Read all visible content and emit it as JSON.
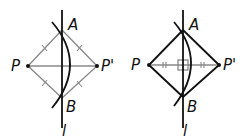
{
  "figures": [
    {
      "id": "left",
      "description": "Perpendicular bisector construction with congruent segment tick marks",
      "labels": {
        "A": "A",
        "B": "B",
        "P": "P",
        "P_prime": "P'",
        "line": "l"
      },
      "points": {
        "A": [
          62,
          30
        ],
        "B": [
          62,
          98
        ],
        "P": [
          28,
          66
        ],
        "P_prime": [
          97,
          66
        ]
      },
      "line_l": {
        "x": 62,
        "y1": 10,
        "y2": 128
      },
      "arc": {
        "from": [
          52,
          22
        ],
        "ctrl": [
          88,
          64
        ],
        "to": [
          52,
          108
        ]
      },
      "segments_style": "gray-with-single-ticks",
      "colors": {
        "thin": "#888888",
        "thick": "#111111"
      }
    },
    {
      "id": "right",
      "description": "Rhombus PAP'B with perpendicular diagonals marked by right-angle square and double ticks",
      "labels": {
        "A": "A",
        "B": "B",
        "P": "P",
        "P_prime": "P'",
        "line": "l"
      },
      "points": {
        "A": [
          183,
          30
        ],
        "B": [
          183,
          97
        ],
        "P": [
          149,
          65
        ],
        "P_prime": [
          219,
          65
        ]
      },
      "line_l": {
        "x": 183,
        "y1": 10,
        "y2": 128
      },
      "arc": {
        "from": [
          174,
          22
        ],
        "ctrl": [
          208,
          62
        ],
        "to": [
          174,
          106
        ]
      },
      "segments_style": "black-sides-double-ticks-on-PP'",
      "colors": {
        "thin": "#888888",
        "thick": "#111111"
      }
    }
  ]
}
